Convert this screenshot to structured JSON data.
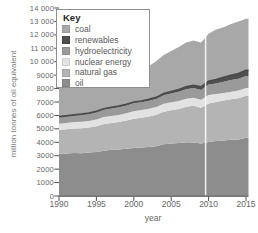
{
  "chart_data": {
    "type": "area",
    "stacked": true,
    "xlabel": "year",
    "ylabel": "million tonnes of oil equivalent",
    "xlim": [
      1990,
      2015
    ],
    "ylim": [
      0,
      14000
    ],
    "grid": false,
    "x_ticks": [
      "1990",
      "1995",
      "2000",
      "2005",
      "2010",
      "2015"
    ],
    "y_ticks": [
      "0",
      "1000",
      "2000",
      "3000",
      "4000",
      "5000",
      "6000",
      "7000",
      "8000",
      "9000",
      "10 000",
      "11 000",
      "12 000",
      "13 000",
      "14 000"
    ],
    "divider_year": 2009.6,
    "divider_color": "#ffffff",
    "axis_color": "#4d4d4d",
    "x": [
      1990,
      1991,
      1992,
      1993,
      1994,
      1995,
      1996,
      1997,
      1998,
      1999,
      2000,
      2001,
      2002,
      2003,
      2004,
      2005,
      2006,
      2007,
      2008,
      2009,
      2010,
      2011,
      2012,
      2013,
      2014,
      2015
    ],
    "series": [
      {
        "name": "oil",
        "color": "#8d8d8d",
        "values": [
          3157,
          3161,
          3210,
          3190,
          3247,
          3283,
          3364,
          3438,
          3461,
          3524,
          3583,
          3611,
          3640,
          3708,
          3858,
          3909,
          3945,
          4010,
          3987,
          3909,
          4032,
          4085,
          4133,
          4185,
          4211,
          4331
        ]
      },
      {
        "name": "natural gas",
        "color": "#b4b4b4",
        "values": [
          1774,
          1807,
          1820,
          1849,
          1856,
          1911,
          2000,
          2005,
          2049,
          2097,
          2176,
          2210,
          2276,
          2346,
          2420,
          2477,
          2535,
          2637,
          2731,
          2661,
          2858,
          2906,
          2987,
          3020,
          3065,
          3135
        ]
      },
      {
        "name": "nuclear energy",
        "color": "#e2e2e2",
        "values": [
          453,
          470,
          475,
          487,
          492,
          508,
          525,
          524,
          533,
          546,
          555,
          575,
          581,
          577,
          594,
          598,
          604,
          599,
          598,
          595,
          626,
          600,
          560,
          563,
          575,
          583
        ]
      },
      {
        "name": "hydroelectricity",
        "color": "#9a9a9a",
        "values": [
          489,
          497,
          500,
          522,
          524,
          548,
          557,
          570,
          575,
          580,
          601,
          585,
          595,
          602,
          637,
          657,
          684,
          700,
          726,
          735,
          779,
          795,
          834,
          861,
          879,
          880
        ]
      },
      {
        "name": "renewables",
        "color": "#4f4f4f",
        "line_color": "#4a4a4a",
        "values": [
          35,
          38,
          41,
          44,
          48,
          52,
          57,
          62,
          68,
          75,
          82,
          90,
          100,
          112,
          126,
          142,
          160,
          180,
          203,
          228,
          256,
          287,
          320,
          355,
          392,
          430
        ]
      },
      {
        "name": "coal",
        "color": "#a8a8a8",
        "values": [
          2220,
          2196,
          2173,
          2189,
          2210,
          2256,
          2317,
          2318,
          2294,
          2330,
          2399,
          2412,
          2478,
          2692,
          2858,
          3012,
          3164,
          3305,
          3342,
          3305,
          3532,
          3724,
          3730,
          3827,
          3862,
          3840
        ]
      }
    ],
    "legend": {
      "title": "Key",
      "position": "top-left",
      "order": [
        "coal",
        "renewables",
        "hydroelectricity",
        "nuclear energy",
        "natural gas",
        "oil"
      ]
    }
  }
}
